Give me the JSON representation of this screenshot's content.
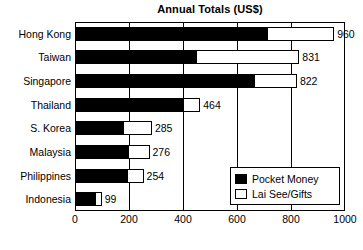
{
  "chart_data": {
    "type": "bar",
    "orientation": "horizontal",
    "stacked": true,
    "title": "Annual Totals (US$)",
    "xlabel": "",
    "ylabel": "",
    "xlim": [
      0,
      1000
    ],
    "xticks": [
      0,
      200,
      400,
      600,
      800,
      1000
    ],
    "xtick_labels": [
      "0",
      "200",
      "400",
      "600",
      "800",
      "1000"
    ],
    "grid": true,
    "grid_axis": "x",
    "legend_position": "bottom-right",
    "categories": [
      "Hong Kong",
      "Taiwan",
      "Singapore",
      "Thailand",
      "S. Korea",
      "Malaysia",
      "Philippines",
      "Indonesia"
    ],
    "series": [
      {
        "name": "Pocket Money",
        "color": "#000000",
        "values": [
          711,
          448,
          663,
          400,
          178,
          197,
          193,
          74
        ]
      },
      {
        "name": "Lai See/Gifts",
        "color": "#ffffff",
        "values": [
          249,
          383,
          159,
          64,
          107,
          79,
          61,
          25
        ]
      }
    ],
    "totals": [
      960,
      831,
      822,
      464,
      285,
      276,
      254,
      99
    ],
    "total_labels": [
      "960",
      "831",
      "822",
      "464",
      "285",
      "276",
      "254",
      "99"
    ]
  },
  "legend": {
    "items": [
      {
        "label": "Pocket Money",
        "swatch": "black-swatch"
      },
      {
        "label": "Lai See/Gifts",
        "swatch": "white-swatch"
      }
    ]
  }
}
